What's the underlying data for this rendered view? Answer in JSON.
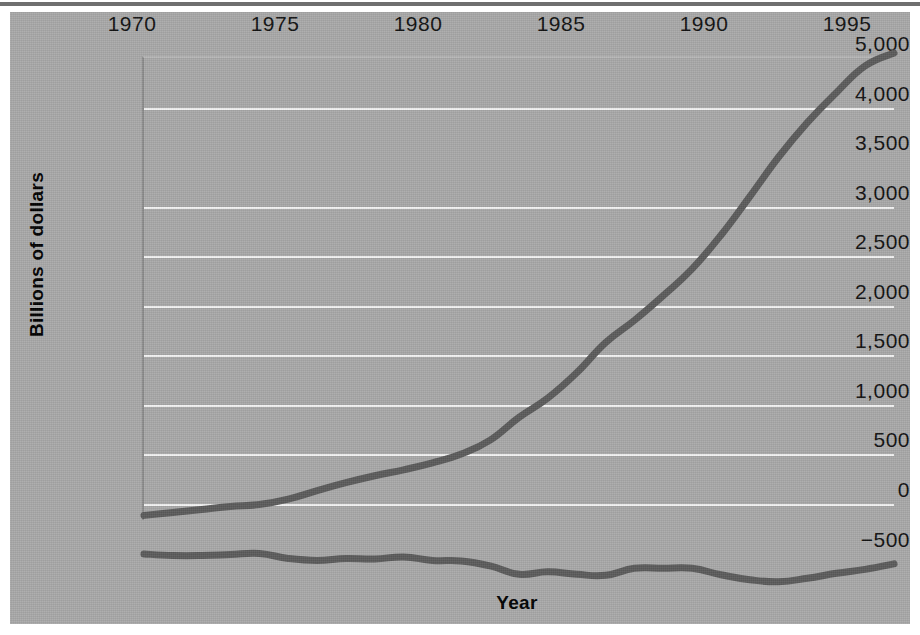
{
  "figure": {
    "background_color": "#a9a9a9",
    "gridline_color": "#f4f4f4",
    "line_color": "#5b5b5b"
  },
  "axes": {
    "ylabel": "Billions of dollars",
    "xlabel": "Year",
    "ytick_labels": [
      "5,000",
      "4,000",
      "3,500",
      "3,000",
      "2,500",
      "2,000",
      "1,500",
      "1,000",
      "500",
      "0",
      "−500"
    ],
    "xtick_labels": [
      "1970",
      "1975",
      "1980",
      "1985",
      "1990",
      "1995"
    ]
  },
  "chart_data": {
    "type": "line",
    "title": "",
    "xlabel": "Year",
    "ylabel": "Billions of dollars",
    "xlim": [
      1970,
      1996
    ],
    "ylim": [
      -500,
      5000
    ],
    "grid": true,
    "legend": "none",
    "ytick_values": [
      5000,
      4500,
      3500,
      3000,
      2500,
      2000,
      1500,
      1000,
      500,
      0,
      -500
    ],
    "ytick_labels": [
      "5,000",
      "4,000",
      "3,500",
      "3,000",
      "2,500",
      "2,000",
      "1,500",
      "1,000",
      "500",
      "0",
      "-500"
    ],
    "xtick_values": [
      1970,
      1975,
      1980,
      1985,
      1990,
      1995
    ],
    "x": [
      1970,
      1971,
      1972,
      1973,
      1974,
      1975,
      1976,
      1977,
      1978,
      1979,
      1980,
      1981,
      1982,
      1983,
      1984,
      1985,
      1986,
      1987,
      1988,
      1989,
      1990,
      1991,
      1992,
      1993,
      1994,
      1995,
      1996
    ],
    "series": [
      {
        "name": "gross-federal-debt",
        "color": "#5b5b5b",
        "values": [
          380,
          410,
          440,
          470,
          490,
          545,
          630,
          710,
          780,
          840,
          910,
          1000,
          1140,
          1370,
          1565,
          1820,
          2125,
          2350,
          2600,
          2870,
          3210,
          3600,
          4000,
          4350,
          4650,
          4920,
          5050
        ]
      },
      {
        "name": "federal-deficit",
        "color": "#5b5b5b",
        "values": [
          -10,
          -25,
          -25,
          -15,
          -5,
          -55,
          -75,
          -55,
          -60,
          -40,
          -75,
          -80,
          -130,
          -215,
          -190,
          -215,
          -225,
          -155,
          -155,
          -155,
          -220,
          -270,
          -290,
          -255,
          -205,
          -165,
          -110
        ]
      }
    ]
  }
}
